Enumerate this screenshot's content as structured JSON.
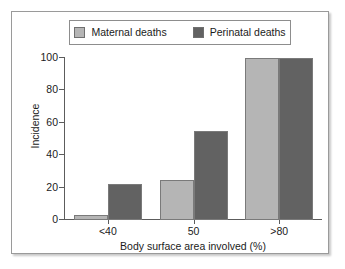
{
  "chart_data": {
    "type": "bar",
    "title": "",
    "subtitle": "",
    "xlabel": "Body surface area involved (%)",
    "ylabel": "Incidence",
    "categories": [
      "<40",
      "50",
      ">80"
    ],
    "series": [
      {
        "name": "Maternal deaths",
        "values": [
          3,
          25,
          100
        ],
        "color": "#b5b5b5"
      },
      {
        "name": "Perinatal deaths",
        "values": [
          22,
          55,
          100
        ],
        "color": "#626262"
      }
    ],
    "ylim": [
      0,
      100
    ],
    "yticks": [
      0,
      20,
      40,
      60,
      80,
      100
    ],
    "ytick_labels": [
      "0",
      "20",
      "40",
      "60",
      "80",
      "100"
    ],
    "grid": false,
    "legend_position": "top",
    "legend_boxed": true,
    "axis_color": "#5c5c5c",
    "text_color": "#1b1b1b",
    "background": "#ffffff",
    "frame_border_color": "#9a9a9a"
  }
}
